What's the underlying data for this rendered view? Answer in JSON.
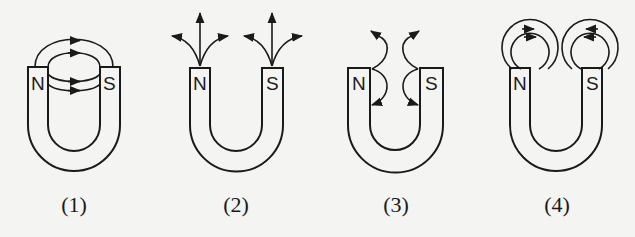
{
  "figure": {
    "diagrams": [
      {
        "caption": "(1)",
        "north_label": "N",
        "south_label": "S",
        "field_pattern": "closed loops from N across to S over the gap"
      },
      {
        "caption": "(2)",
        "north_label": "N",
        "south_label": "S",
        "field_pattern": "three arrows radiating outward from each pole"
      },
      {
        "caption": "(3)",
        "north_label": "N",
        "south_label": "S",
        "field_pattern": "curved lines in the gap bending back into each pole"
      },
      {
        "caption": "(4)",
        "north_label": "N",
        "south_label": "S",
        "field_pattern": "two concentric loops above each pole"
      }
    ]
  },
  "colors": {
    "ink": "#1a1a1a",
    "paper": "#f4f4f2"
  }
}
